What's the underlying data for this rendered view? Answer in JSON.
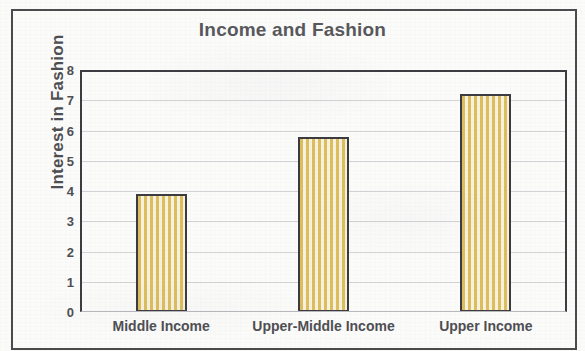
{
  "chart_data": {
    "type": "bar",
    "title": "Income and Fashion",
    "xlabel": "",
    "ylabel": "Interest in Fashion",
    "categories": [
      "Middle Income",
      "Upper-Middle Income",
      "Upper Income"
    ],
    "values": [
      3.9,
      5.8,
      7.2
    ],
    "series": [
      {
        "name": "Interest in Fashion",
        "values": [
          3.9,
          5.8,
          7.2
        ]
      }
    ],
    "ylim": [
      0,
      8
    ],
    "ytick_labels": [
      "8",
      "7",
      "6",
      "5",
      "4",
      "3",
      "2",
      "1",
      "0"
    ],
    "ytick_values": [
      8,
      7,
      6,
      5,
      4,
      3,
      2,
      1,
      0
    ],
    "grid": true,
    "grid_axis": "y",
    "legend": false,
    "legend_position": "none",
    "bar_fill": "vertical-stripe",
    "colors": {
      "bar_stripe_dark": "#ddbe5e",
      "bar_stripe_light": "#f7f2de",
      "bar_border": "#3b3b3f",
      "text": "#4e4e52",
      "title_text": "#58585c",
      "gridline": "#d2d3d7",
      "axis": "#3c3c40",
      "page_background": "#fbfbfa",
      "outer_border": "#4a4a4d"
    }
  }
}
